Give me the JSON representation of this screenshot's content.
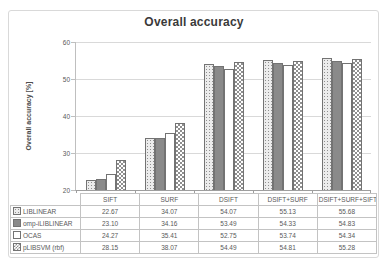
{
  "figure": {
    "title": "Overall accuracy",
    "border_color": "#d9d9d9"
  },
  "chart_data": {
    "type": "bar",
    "title": "Overall accuracy",
    "xlabel": "",
    "ylabel": "Overall accuracy [%]",
    "ylim": [
      20,
      60
    ],
    "yticks": [
      20,
      30,
      40,
      50,
      60
    ],
    "grid": true,
    "legend_position": "data-table-left-column",
    "value_decimals": 2,
    "categories": [
      "SIFT",
      "SURF",
      "DSIFT",
      "DSIFT+SURF",
      "DSIFT+SURF+SIFT"
    ],
    "series": [
      {
        "name": "LIBLINEAR",
        "pattern": "dotted-light",
        "values": [
          22.67,
          34.07,
          54.07,
          55.13,
          55.68
        ]
      },
      {
        "name": "omp-iLIBLINEAR",
        "pattern": "solid-gray",
        "values": [
          23.1,
          34.16,
          53.49,
          54.33,
          54.83
        ]
      },
      {
        "name": "OCAS",
        "pattern": "white",
        "values": [
          24.27,
          35.41,
          52.75,
          53.74,
          54.34
        ]
      },
      {
        "name": "pLIBSVM (rbf)",
        "pattern": "checker",
        "values": [
          28.15,
          38.07,
          54.49,
          54.81,
          55.28
        ]
      }
    ],
    "colors": {
      "series_dotted_fill": "#ececec",
      "series_solid_gray": "#8a8a8a",
      "series_white": "#ffffff",
      "pattern_ink": "#8f8f8f",
      "bar_outline": "#737373",
      "gridline": "#d9d9d9",
      "axis_line": "#9e9e9e",
      "text": "#595959",
      "title_text": "#3a3a3a",
      "table_border": "#c3c3c3"
    }
  }
}
